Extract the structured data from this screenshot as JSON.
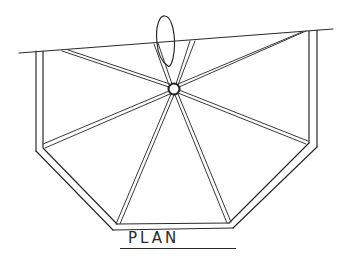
{
  "drawing": {
    "title": "PLAN",
    "type": "architectural plan sketch",
    "description": "Octagonal-ish plan with radial spokes from central hub and leaf/ellipse element at top",
    "stroke_color": "#2a2a2a",
    "background_color": "#ffffff"
  },
  "label": {
    "text": "PLAN"
  }
}
